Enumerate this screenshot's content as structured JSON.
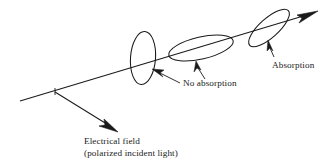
{
  "figure": {
    "background_color": "#ffffff",
    "stroke_color": "#1a1a1a",
    "text_color": "#1a1a1a",
    "width": 333,
    "height": 166
  },
  "labels": {
    "electrical_field_line1": "Electrical field",
    "electrical_field_line2": "(polarized incident light)",
    "no_absorption": "No absorption",
    "absorption": "Absorption"
  },
  "elements": {
    "beam_axis": "incident light beam line",
    "polarizer_1": "vertical polarizer ellipse",
    "polarizer_2": "tilted polarizer ellipse",
    "polarizer_3": "steeply tilted polarizer ellipse",
    "field_arrow": "electrical field direction arrow",
    "output_arrow": "transmitted beam arrow"
  }
}
